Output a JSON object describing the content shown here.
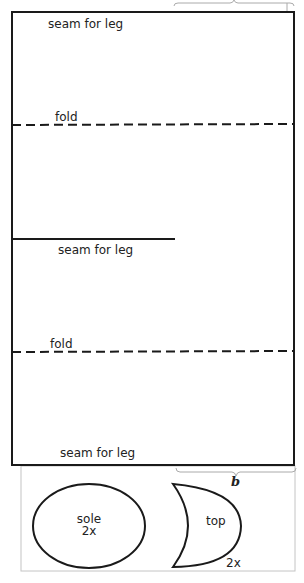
{
  "diagram": {
    "pattern_piece": {
      "labels": {
        "seam_top": "seam for leg",
        "fold_1": "fold",
        "seam_middle": "seam for leg",
        "fold_2": "fold",
        "seam_bottom": "seam for leg"
      }
    },
    "bracket_label": "b",
    "sole": {
      "name": "sole",
      "count": "2x"
    },
    "top": {
      "name": "top",
      "count": "2x"
    },
    "colors": {
      "line": "#1a1a1a",
      "light_line": "#bdbdbd"
    }
  }
}
